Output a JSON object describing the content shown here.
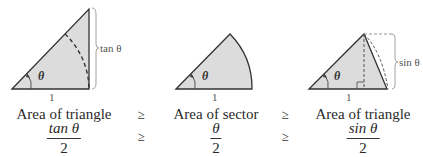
{
  "colors": {
    "fill": "#dcdcdc",
    "stroke": "#333333",
    "dashed": "#555555",
    "brace": "#999999"
  },
  "panels": [
    {
      "name": "large-triangle",
      "angle_label": "θ",
      "base_label": "1",
      "side_label": "tan θ",
      "caption": "Area of triangle",
      "formula": {
        "numerator": "tan θ",
        "denominator": "2"
      }
    },
    {
      "name": "sector",
      "angle_label": "θ",
      "base_label": "1",
      "caption": "Area of sector",
      "formula": {
        "numerator": "θ",
        "denominator": "2"
      }
    },
    {
      "name": "small-triangle",
      "angle_label": "θ",
      "base_label": "1",
      "side_label": "sin θ",
      "caption": "Area of triangle",
      "formula": {
        "numerator": "sin θ",
        "denominator": "2"
      }
    }
  ],
  "relations": [
    "≥",
    "≥"
  ]
}
